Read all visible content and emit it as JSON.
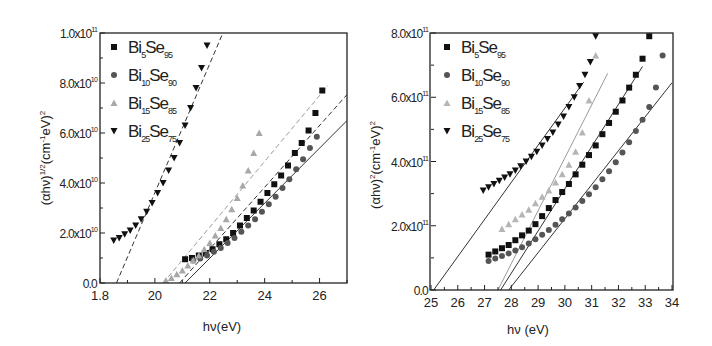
{
  "chart_data": [
    {
      "type": "scatter",
      "title": "",
      "xlabel": "hν(eV)",
      "ylabel": "(αhν)^1/2(cm^-1eV)^2",
      "xlim": [
        18,
        27
      ],
      "ylim": [
        0,
        100000000000.0
      ],
      "x_ticks": [
        "1.8",
        "20",
        "22",
        "24",
        "26"
      ],
      "x_tick_values": [
        18,
        20,
        22,
        24,
        26
      ],
      "y_ticks": [
        "0.0",
        "2.0x10^10",
        "4.0x10^10",
        "6.0x10^10",
        "8.0x10^10",
        "1.0x10^11"
      ],
      "y_tick_values": [
        0,
        20000000000.0,
        40000000000.0,
        60000000000.0,
        80000000000.0,
        100000000000.0
      ],
      "grid": false,
      "legend_position": "upper-left",
      "series": [
        {
          "name": "Bi5Se95",
          "marker": "square",
          "color": "#111111",
          "x": [
            21.1,
            21.35,
            21.6,
            21.85,
            22.1,
            22.35,
            22.6,
            22.85,
            23.1,
            23.35,
            23.6,
            23.85,
            24.1,
            24.35,
            24.6,
            24.85,
            25.1,
            25.35,
            25.6,
            25.85,
            26.1
          ],
          "y": [
            9500000000.0,
            10000000000.0,
            11000000000.0,
            12000000000.0,
            13500000000.0,
            15500000000.0,
            17500000000.0,
            20000000000.0,
            23000000000.0,
            26000000000.0,
            29000000000.0,
            32500000000.0,
            36000000000.0,
            39500000000.0,
            43000000000.0,
            47000000000.0,
            52000000000.0,
            56000000000.0,
            61000000000.0,
            68000000000.0,
            77000000000.0
          ]
        },
        {
          "name": "Bi10Se90",
          "marker": "circle",
          "color": "#555555",
          "x": [
            21.4,
            21.65,
            21.9,
            22.15,
            22.4,
            22.65,
            22.9,
            23.15,
            23.4,
            23.65,
            23.9,
            24.15,
            24.4,
            24.65,
            24.9,
            25.15,
            25.4,
            25.65,
            25.9
          ],
          "y": [
            9000000000.0,
            9800000000.0,
            11000000000.0,
            12500000000.0,
            14000000000.0,
            16000000000.0,
            18000000000.0,
            20500000000.0,
            23000000000.0,
            25500000000.0,
            28500000000.0,
            31500000000.0,
            34500000000.0,
            38000000000.0,
            41500000000.0,
            45500000000.0,
            49500000000.0,
            54000000000.0,
            58500000000.0
          ]
        },
        {
          "name": "Bi15Se85",
          "marker": "triangle-up",
          "color": "#a8a8a8",
          "x": [
            20.4,
            20.6,
            20.8,
            21.0,
            21.2,
            21.4,
            21.6,
            21.8,
            22.0,
            22.2,
            22.4,
            22.6,
            22.8,
            23.0,
            23.2,
            23.4,
            23.6,
            23.8
          ],
          "y": [
            1000000000.0,
            2000000000.0,
            3500000000.0,
            5000000000.0,
            7000000000.0,
            9000000000.0,
            11000000000.0,
            13500000000.0,
            16000000000.0,
            19000000000.0,
            22000000000.0,
            25500000000.0,
            29500000000.0,
            34000000000.0,
            39000000000.0,
            45000000000.0,
            52000000000.0,
            60000000000.0
          ]
        },
        {
          "name": "Bi25Se75",
          "marker": "triangle-down",
          "color": "#111111",
          "x": [
            18.5,
            18.7,
            18.9,
            19.1,
            19.3,
            19.5,
            19.7,
            19.9,
            20.1,
            20.3,
            20.5,
            20.7,
            20.9,
            21.1,
            21.3,
            21.5,
            21.7,
            21.9
          ],
          "y": [
            17000000000.0,
            18000000000.0,
            19500000000.0,
            21000000000.0,
            23000000000.0,
            25500000000.0,
            28500000000.0,
            32000000000.0,
            36000000000.0,
            40000000000.0,
            45000000000.0,
            50000000000.0,
            56000000000.0,
            63000000000.0,
            70000000000.0,
            78000000000.0,
            86000000000.0,
            95000000000.0
          ]
        }
      ],
      "fit_lines": [
        {
          "series": "Bi25Se75",
          "style": "dashed",
          "x_intercept": 18.6,
          "x_end": 22.6
        },
        {
          "series": "Bi15Se85",
          "style": "dashed",
          "x_intercept": 20.3,
          "x_end": 26.3
        },
        {
          "series": "Bi5Se95",
          "style": "dashed",
          "x_intercept": 20.9,
          "x_end": 27.0
        },
        {
          "series": "Bi10Se90",
          "style": "solid",
          "x_intercept": 21.1,
          "x_end": 27.0
        }
      ]
    },
    {
      "type": "scatter",
      "title": "",
      "xlabel": "hν (eV)",
      "ylabel": "(αhν)^2(cm^-1eV)^2",
      "xlim": [
        25,
        34
      ],
      "ylim": [
        0,
        800000000000.0
      ],
      "x_ticks": [
        "25",
        "26",
        "27",
        "28",
        "29",
        "30",
        "31",
        "32",
        "33",
        "34"
      ],
      "x_tick_values": [
        25,
        26,
        27,
        28,
        29,
        30,
        31,
        32,
        33,
        34
      ],
      "y_ticks": [
        "0.0",
        "2.0x10^11",
        "4.0x10^11",
        "6.0x10^11",
        "8.0x10^11"
      ],
      "y_tick_values": [
        0,
        200000000000.0,
        400000000000.0,
        600000000000.0,
        800000000000.0
      ],
      "grid": false,
      "legend_position": "upper-left",
      "series": [
        {
          "name": "Bi5Se95",
          "marker": "square",
          "color": "#111111",
          "x": [
            27.15,
            27.4,
            27.65,
            27.9,
            28.15,
            28.4,
            28.65,
            28.9,
            29.15,
            29.4,
            29.65,
            29.9,
            30.15,
            30.4,
            30.65,
            30.9,
            31.15,
            31.4,
            31.65,
            31.9,
            32.15,
            32.4,
            32.65,
            32.9,
            33.15
          ],
          "y": [
            110000000000.0,
            120000000000.0,
            130000000000.0,
            140000000000.0,
            155000000000.0,
            170000000000.0,
            185000000000.0,
            205000000000.0,
            230000000000.0,
            255000000000.0,
            280000000000.0,
            305000000000.0,
            330000000000.0,
            360000000000.0,
            390000000000.0,
            420000000000.0,
            450000000000.0,
            485000000000.0,
            520000000000.0,
            555000000000.0,
            590000000000.0,
            630000000000.0,
            670000000000.0,
            720000000000.0,
            790000000000.0
          ]
        },
        {
          "name": "Bi10Se90",
          "marker": "circle",
          "color": "#555555",
          "x": [
            27.15,
            27.4,
            27.65,
            27.9,
            28.15,
            28.4,
            28.65,
            28.9,
            29.15,
            29.4,
            29.65,
            29.9,
            30.15,
            30.4,
            30.65,
            30.9,
            31.15,
            31.4,
            31.65,
            31.9,
            32.15,
            32.4,
            32.65,
            32.9,
            33.15,
            33.4,
            33.65
          ],
          "y": [
            90000000000.0,
            98000000000.0,
            106000000000.0,
            114000000000.0,
            123000000000.0,
            133000000000.0,
            145000000000.0,
            158000000000.0,
            172000000000.0,
            187000000000.0,
            203000000000.0,
            220000000000.0,
            238000000000.0,
            257000000000.0,
            277000000000.0,
            298000000000.0,
            320000000000.0,
            345000000000.0,
            370000000000.0,
            398000000000.0,
            428000000000.0,
            460000000000.0,
            495000000000.0,
            530000000000.0,
            570000000000.0,
            630000000000.0,
            730000000000.0
          ]
        },
        {
          "name": "Bi15Se85",
          "marker": "triangle-up",
          "color": "#b5b5b5",
          "x": [
            27.65,
            27.9,
            28.15,
            28.4,
            28.65,
            28.9,
            29.15,
            29.4,
            29.65,
            29.9,
            30.15,
            30.4,
            30.65,
            30.9,
            31.15
          ],
          "y": [
            190000000000.0,
            205000000000.0,
            220000000000.0,
            235000000000.0,
            250000000000.0,
            270000000000.0,
            290000000000.0,
            310000000000.0,
            335000000000.0,
            360000000000.0,
            390000000000.0,
            430000000000.0,
            490000000000.0,
            590000000000.0,
            730000000000.0
          ]
        },
        {
          "name": "Bi25Se75",
          "marker": "triangle-down",
          "color": "#111111",
          "x": [
            26.95,
            27.15,
            27.35,
            27.55,
            27.75,
            27.95,
            28.15,
            28.35,
            28.55,
            28.75,
            28.95,
            29.15,
            29.35,
            29.55,
            29.75,
            29.95,
            30.15,
            30.35,
            30.55,
            30.75,
            30.95,
            31.15
          ],
          "y": [
            310000000000.0,
            320000000000.0,
            330000000000.0,
            340000000000.0,
            350000000000.0,
            360000000000.0,
            372000000000.0,
            385000000000.0,
            400000000000.0,
            415000000000.0,
            430000000000.0,
            450000000000.0,
            470000000000.0,
            490000000000.0,
            515000000000.0,
            540000000000.0,
            570000000000.0,
            600000000000.0,
            635000000000.0,
            670000000000.0,
            710000000000.0,
            790000000000.0
          ]
        }
      ],
      "fit_lines": [
        {
          "series": "Bi25Se75",
          "style": "solid",
          "x_intercept": 25.1,
          "x_end": 30.7
        },
        {
          "series": "Bi15Se85",
          "style": "solid",
          "x_intercept": 27.5,
          "x_end": 31.6
        },
        {
          "series": "Bi5Se95",
          "style": "solid",
          "x_intercept": 27.6,
          "x_end": 32.9
        },
        {
          "series": "Bi10Se90",
          "style": "solid",
          "x_intercept": 27.9,
          "x_end": 34.0
        }
      ]
    }
  ],
  "left_chart": {
    "y_ticks": [
      {
        "mant": "0.0",
        "exp": ""
      },
      {
        "mant": "2.0x10",
        "exp": "10"
      },
      {
        "mant": "4.0x10",
        "exp": "10"
      },
      {
        "mant": "6.0x10",
        "exp": "10"
      },
      {
        "mant": "8.0x10",
        "exp": "10"
      },
      {
        "mant": "1.0x10",
        "exp": "11"
      }
    ],
    "x_ticks": [
      "1.8",
      "20",
      "22",
      "24",
      "26"
    ],
    "xlabel": "hν(eV)",
    "ylabel": {
      "pre": "(αhν)",
      "sup1": "1/2",
      "mid": "(cm",
      "sup2": "-1",
      "post": "eV)",
      "sup3": "2"
    },
    "legend": [
      {
        "base": "Bi",
        "sub1": "5",
        "mid": "Se",
        "sub2": "95"
      },
      {
        "base": "Bi",
        "sub1": "10",
        "mid": "Se",
        "sub2": "90"
      },
      {
        "base": "Bi",
        "sub1": "15",
        "mid": "Se",
        "sub2": "85"
      },
      {
        "base": "Bi",
        "sub1": "25",
        "mid": "Se",
        "sub2": "75"
      }
    ]
  },
  "right_chart": {
    "y_ticks": [
      {
        "mant": "0.0",
        "exp": ""
      },
      {
        "mant": "2.0x10",
        "exp": "11"
      },
      {
        "mant": "4.0x10",
        "exp": "11"
      },
      {
        "mant": "6.0x10",
        "exp": "11"
      },
      {
        "mant": "8.0x10",
        "exp": "11"
      }
    ],
    "x_ticks": [
      "25",
      "26",
      "27",
      "28",
      "29",
      "30",
      "31",
      "32",
      "33",
      "34"
    ],
    "xlabel": "hν (eV)",
    "ylabel": {
      "pre": "(αhν)",
      "sup1": "2",
      "mid": "(cm",
      "sup2": "-1",
      "post": "eV)",
      "sup3": "2"
    },
    "legend": [
      {
        "base": "Bi",
        "sub1": "5",
        "mid": "Se",
        "sub2": "95"
      },
      {
        "base": "Bi",
        "sub1": "10",
        "mid": "Se",
        "sub2": "90"
      },
      {
        "base": "Bi",
        "sub1": "15",
        "mid": "Se",
        "sub2": "85"
      },
      {
        "base": "Bi",
        "sub1": "25",
        "mid": "Se",
        "sub2": "75"
      }
    ]
  }
}
